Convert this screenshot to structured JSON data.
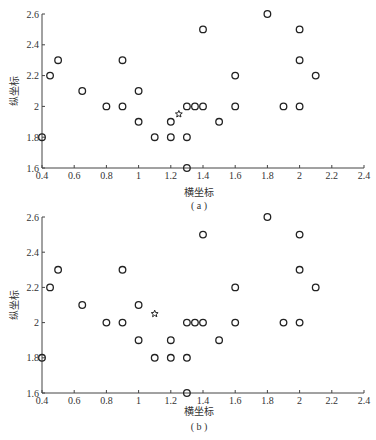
{
  "chart_data": [
    {
      "type": "scatter",
      "caption": "(a)",
      "xlabel": "横坐标",
      "ylabel": "纵坐标",
      "xlim": [
        0.4,
        2.4
      ],
      "ylim": [
        1.6,
        2.6
      ],
      "xticks": [
        "0.4",
        "0.6",
        "0.8",
        "1",
        "1.2",
        "1.4",
        "1.6",
        "1.8",
        "2",
        "2.2",
        "2.4"
      ],
      "yticks": [
        "1.6",
        "1.8",
        "2",
        "2.2",
        "2.4",
        "2.6"
      ],
      "grid": false,
      "series": [
        {
          "name": "circles",
          "marker": "o",
          "points": [
            [
              0.4,
              1.8
            ],
            [
              0.45,
              2.2
            ],
            [
              0.5,
              2.3
            ],
            [
              0.65,
              2.1
            ],
            [
              0.8,
              2.0
            ],
            [
              0.9,
              2.3
            ],
            [
              0.9,
              2.0
            ],
            [
              1.0,
              2.1
            ],
            [
              1.0,
              1.9
            ],
            [
              1.1,
              1.8
            ],
            [
              1.2,
              1.9
            ],
            [
              1.2,
              1.8
            ],
            [
              1.3,
              2.0
            ],
            [
              1.3,
              1.8
            ],
            [
              1.3,
              1.6
            ],
            [
              1.35,
              2.0
            ],
            [
              1.4,
              2.0
            ],
            [
              1.4,
              2.5
            ],
            [
              1.5,
              1.9
            ],
            [
              1.6,
              2.2
            ],
            [
              1.6,
              2.0
            ],
            [
              1.8,
              2.6
            ],
            [
              1.9,
              2.0
            ],
            [
              2.0,
              2.5
            ],
            [
              2.0,
              2.3
            ],
            [
              2.0,
              2.0
            ],
            [
              2.1,
              2.2
            ]
          ]
        },
        {
          "name": "star",
          "marker": "star",
          "points": [
            [
              1.25,
              1.95
            ]
          ]
        }
      ]
    },
    {
      "type": "scatter",
      "caption": "(b)",
      "xlabel": "横坐标",
      "ylabel": "纵坐标",
      "xlim": [
        0.4,
        2.4
      ],
      "ylim": [
        1.6,
        2.6
      ],
      "xticks": [
        "0.4",
        "0.6",
        "0.8",
        "1",
        "1.2",
        "1.4",
        "1.6",
        "1.8",
        "2",
        "2.2",
        "2.4"
      ],
      "yticks": [
        "1.6",
        "1.8",
        "2",
        "2.2",
        "2.4",
        "2.6"
      ],
      "grid": false,
      "series": [
        {
          "name": "circles",
          "marker": "o",
          "points": [
            [
              0.4,
              1.8
            ],
            [
              0.45,
              2.2
            ],
            [
              0.5,
              2.3
            ],
            [
              0.65,
              2.1
            ],
            [
              0.8,
              2.0
            ],
            [
              0.9,
              2.3
            ],
            [
              0.9,
              2.0
            ],
            [
              1.0,
              2.1
            ],
            [
              1.0,
              1.9
            ],
            [
              1.1,
              1.8
            ],
            [
              1.2,
              1.9
            ],
            [
              1.2,
              1.8
            ],
            [
              1.3,
              2.0
            ],
            [
              1.3,
              1.8
            ],
            [
              1.3,
              1.6
            ],
            [
              1.35,
              2.0
            ],
            [
              1.4,
              2.0
            ],
            [
              1.4,
              2.5
            ],
            [
              1.5,
              1.9
            ],
            [
              1.6,
              2.2
            ],
            [
              1.6,
              2.0
            ],
            [
              1.8,
              2.6
            ],
            [
              1.9,
              2.0
            ],
            [
              2.0,
              2.5
            ],
            [
              2.0,
              2.3
            ],
            [
              2.0,
              2.0
            ],
            [
              2.1,
              2.2
            ]
          ]
        },
        {
          "name": "star",
          "marker": "star",
          "points": [
            [
              1.1,
              2.05
            ]
          ]
        }
      ]
    }
  ],
  "layout": [
    {
      "x0": 42,
      "x1": 364,
      "ytop": 14,
      "ybot": 168,
      "xlabelY": 196,
      "captionY": 209
    },
    {
      "x0": 42,
      "x1": 364,
      "ytop": 217,
      "ybot": 393,
      "xlabelY": 415,
      "captionY": 430
    }
  ]
}
